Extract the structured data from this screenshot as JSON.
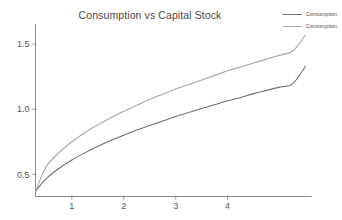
{
  "chart_data": {
    "type": "line",
    "title": "Consumption vs Capital Stock",
    "xlabel": "",
    "ylabel": "",
    "xlim": [
      0.3,
      5.5
    ],
    "ylim": [
      0.33,
      1.62
    ],
    "xticks": [
      1,
      2,
      3,
      4
    ],
    "xtick_labels": [
      "1",
      "2",
      "3",
      "4"
    ],
    "yticks": [
      0.5,
      1.0,
      1.5
    ],
    "ytick_labels": [
      "0.5",
      "1.0",
      "1.5"
    ],
    "grid": false,
    "legend_position": "top-right",
    "series": [
      {
        "name": "Consumption",
        "color": "#6f6f6f",
        "x": [
          0.3,
          0.5,
          0.75,
          1.0,
          1.25,
          1.5,
          1.75,
          2.0,
          2.25,
          2.5,
          2.75,
          3.0,
          3.25,
          3.5,
          3.75,
          4.0,
          4.25,
          4.5,
          4.75,
          5.0,
          5.25,
          5.5
        ],
        "values": [
          0.37,
          0.465,
          0.545,
          0.61,
          0.665,
          0.715,
          0.76,
          0.8,
          0.84,
          0.875,
          0.91,
          0.945,
          0.975,
          1.005,
          1.035,
          1.065,
          1.09,
          1.12,
          1.145,
          1.17,
          1.195,
          1.33
        ]
      },
      {
        "name": "Consumption",
        "color": "#a6a6a6",
        "x": [
          0.3,
          0.5,
          0.75,
          1.0,
          1.25,
          1.5,
          1.75,
          2.0,
          2.25,
          2.5,
          2.75,
          3.0,
          3.25,
          3.5,
          3.75,
          4.0,
          4.25,
          4.5,
          4.75,
          5.0,
          5.25,
          5.5
        ],
        "values": [
          0.37,
          0.555,
          0.665,
          0.75,
          0.82,
          0.88,
          0.935,
          0.985,
          1.03,
          1.075,
          1.115,
          1.155,
          1.19,
          1.225,
          1.26,
          1.295,
          1.325,
          1.355,
          1.385,
          1.415,
          1.445,
          1.57
        ]
      }
    ]
  },
  "legend": {
    "entries": [
      {
        "label": "Consumption",
        "color": "#6f6f6f"
      },
      {
        "label": "Consumption",
        "color": "#a6a6a6"
      }
    ]
  },
  "colors": {
    "background": "#ffffff",
    "axis": "#8a8a8a",
    "title_text": "#4a4a4a",
    "tick_text": "#555555",
    "series_dark": "#6f6f6f",
    "series_light": "#a6a6a6"
  }
}
